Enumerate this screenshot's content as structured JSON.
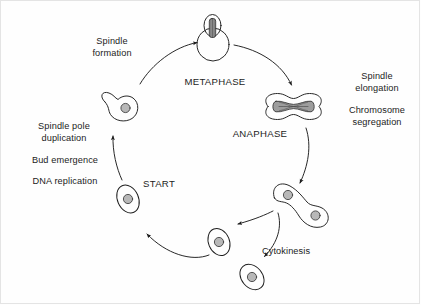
{
  "diagram": {
    "type": "cycle-diagram",
    "background_color": "#fefefe",
    "stroke_color": "#1c1c1c",
    "nucleus_fill": "#b8b8b8",
    "spindle_fill": "#9a9a9a",
    "labels": {
      "spindle_formation": {
        "line1": "Spindle",
        "line2": "formation"
      },
      "metaphase": "METAPHASE",
      "spindle_elongation": {
        "line1": "Spindle",
        "line2": "elongation"
      },
      "chromosome_segregation": {
        "line1": "Chromosome",
        "line2": "segregation"
      },
      "anaphase": "ANAPHASE",
      "cytokinesis": "Cytokinesis",
      "start": "START",
      "spindle_pole_duplication": {
        "line1": "Spindle pole",
        "line2": "duplication"
      },
      "bud_emergence": "Bud emergence",
      "dna_replication": "DNA replication"
    },
    "stages": [
      {
        "name": "start-cell",
        "label": "START",
        "description": "unbudded cell with nucleus"
      },
      {
        "name": "budded-cell",
        "label": "Spindle pole duplication / Bud emergence / DNA replication",
        "description": "cell with small bud and nucleus"
      },
      {
        "name": "metaphase-cell",
        "label": "METAPHASE",
        "description": "budded cell with short spindle in bud neck"
      },
      {
        "name": "anaphase-cell",
        "label": "ANAPHASE",
        "description": "dumbbell cell with elongated spindle"
      },
      {
        "name": "cytokinesis-pair",
        "label": "Cytokinesis",
        "description": "two joined cells each with a nucleus"
      },
      {
        "name": "daughter-cell-upper",
        "label": "",
        "description": "separated daughter cell"
      },
      {
        "name": "daughter-cell-lower",
        "label": "",
        "description": "separated daughter cell"
      }
    ],
    "arrows": [
      {
        "name": "arrow-budded-to-metaphase",
        "from": "budded-cell",
        "to": "metaphase-cell"
      },
      {
        "name": "arrow-metaphase-to-anaphase",
        "from": "metaphase-cell",
        "to": "anaphase-cell"
      },
      {
        "name": "arrow-anaphase-to-cytokinesis",
        "from": "anaphase-cell",
        "to": "cytokinesis-pair"
      },
      {
        "name": "arrow-pair-to-daughter-upper",
        "from": "cytokinesis-pair",
        "to": "daughter-cell-upper"
      },
      {
        "name": "arrow-pair-to-daughter-lower",
        "from": "cytokinesis-pair",
        "to": "daughter-cell-lower"
      },
      {
        "name": "arrow-daughter-to-start",
        "from": "daughter-cell-upper",
        "to": "start-cell"
      },
      {
        "name": "arrow-start-to-budded",
        "from": "start-cell",
        "to": "budded-cell"
      }
    ]
  }
}
